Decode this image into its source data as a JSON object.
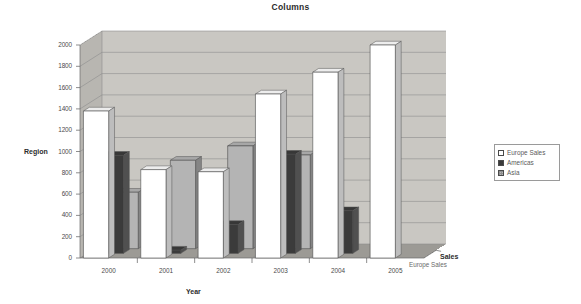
{
  "chart_data": {
    "type": "bar",
    "title": "Columns",
    "xlabel": "Year",
    "ylabel": "Region",
    "zlabel": "Sales",
    "categories": [
      "2000",
      "2001",
      "2002",
      "2003",
      "2004",
      "2005"
    ],
    "series": [
      {
        "name": "Europe Sales",
        "values": [
          1380,
          830,
          810,
          1540,
          1745,
          2000
        ],
        "color": "#ffffff"
      },
      {
        "name": "Americas",
        "values": [
          920,
          30,
          270,
          930,
          400,
          0
        ],
        "color": "#3b3b3b"
      },
      {
        "name": "Asia",
        "values": [
          530,
          830,
          965,
          880,
          0,
          0
        ],
        "color": "#b4b4b4"
      }
    ],
    "ylim": [
      0,
      2000
    ],
    "ytick_step": 200,
    "yticks": [
      "0",
      "200",
      "400",
      "600",
      "800",
      "1000",
      "1200",
      "1400",
      "1600",
      "1800",
      "2000"
    ],
    "grid": true,
    "legend_position": "right",
    "depth_ticks": [
      "Europe Sales"
    ],
    "projection": "3d"
  },
  "legend": {
    "items": [
      {
        "label": "Europe Sales",
        "swatch": "europe"
      },
      {
        "label": "Americas",
        "swatch": "americas"
      },
      {
        "label": "Asia",
        "swatch": "asia"
      }
    ]
  },
  "colors": {
    "wall_back": "#c9c7c2",
    "wall_side": "#b8b6b1",
    "floor": "#9c9a95",
    "europe": "#ffffff",
    "americas": "#3b3b3b",
    "asia": "#b4b4b4",
    "grid": "#8d8d8d"
  }
}
